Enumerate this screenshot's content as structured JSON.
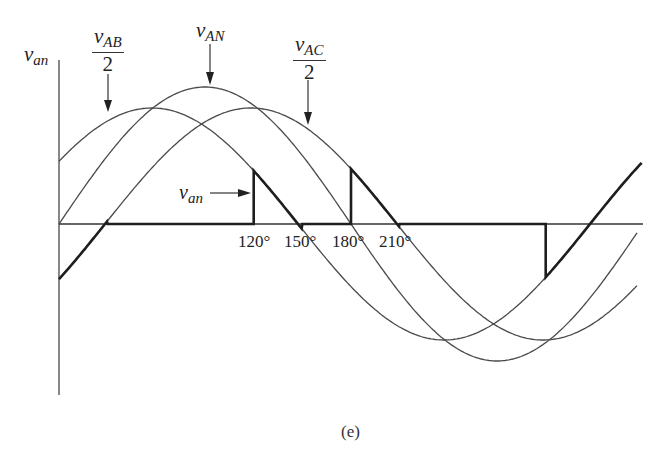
{
  "figure": {
    "caption": "(e)",
    "y_axis_label": {
      "symbol": "v",
      "subscript": "an"
    },
    "labels": {
      "vab_half": {
        "symbol": "v",
        "subscript": "AB",
        "denominator": "2"
      },
      "van_main": {
        "symbol": "v",
        "subscript": "AN"
      },
      "vac_half": {
        "symbol": "v",
        "subscript": "AC",
        "denominator": "2"
      },
      "van_inner": {
        "symbol": "v",
        "subscript": "an"
      }
    },
    "angle_ticks": [
      "120°",
      "150°",
      "180°",
      "210°"
    ],
    "colors": {
      "curve": "#4a4a4a",
      "waveform": "#1e1e1e",
      "background": "#ffffff"
    }
  },
  "chart_data": {
    "type": "line",
    "title": "",
    "xlabel": "θ (degrees)",
    "ylabel": "v_an",
    "x_tick_labels": [
      "120°",
      "150°",
      "180°",
      "210°"
    ],
    "series": [
      {
        "name": "v_AN",
        "kind": "sine",
        "amplitude": 1.0,
        "phase_deg": 0
      },
      {
        "name": "v_AB/2",
        "kind": "sine",
        "amplitude": 0.85,
        "phase_deg": 30
      },
      {
        "name": "v_AC/2",
        "kind": "sine",
        "amplitude": 0.85,
        "phase_deg": -30
      },
      {
        "name": "v_an",
        "kind": "piecewise",
        "segments": [
          {
            "from_deg": 0,
            "to_deg": 30,
            "follows": "v_AC/2"
          },
          {
            "from_deg": 30,
            "to_deg": 120,
            "value": 0
          },
          {
            "from_deg": 120,
            "to_deg": 150,
            "follows": "v_AB/2"
          },
          {
            "from_deg": 150,
            "to_deg": 180,
            "value": 0
          },
          {
            "from_deg": 180,
            "to_deg": 210,
            "follows": "v_AC/2"
          },
          {
            "from_deg": 210,
            "to_deg": 300,
            "value": 0
          },
          {
            "from_deg": 300,
            "to_deg": 330,
            "follows": "v_AB/2"
          },
          {
            "from_deg": 330,
            "to_deg": 360,
            "value": 0
          }
        ]
      }
    ],
    "xlim": [
      0,
      360
    ],
    "grid": false,
    "legend": "inline arrow labels"
  },
  "geometry": {
    "axis_y": 224,
    "origin_x": 59,
    "half_period_px": 292,
    "x_end": 637,
    "curves": [
      {
        "id": "van",
        "x0": 59,
        "amp": 137,
        "x_start": 59,
        "x_end": 637
      },
      {
        "id": "vab2",
        "x0": 6,
        "amp": 116,
        "x_start": 59,
        "x_end": 642
      },
      {
        "id": "vac2",
        "x0": 105,
        "amp": 116,
        "x_start": 59,
        "x_end": 637
      }
    ]
  }
}
